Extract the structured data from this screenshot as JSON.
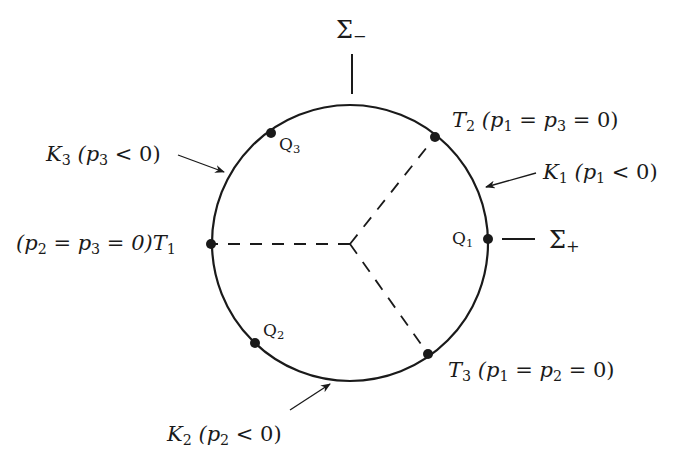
{
  "diagram": {
    "circle": {
      "cx": 350,
      "cy": 243,
      "r": 138,
      "stroke": "#1a1a1a"
    },
    "center": {
      "x": 350,
      "y": 244
    },
    "points": [
      {
        "id": "T1",
        "x": 211,
        "y": 244
      },
      {
        "id": "T2",
        "x": 435,
        "y": 137
      },
      {
        "id": "T3",
        "x": 428,
        "y": 354
      },
      {
        "id": "Q1",
        "x": 488,
        "y": 239
      },
      {
        "id": "Q2",
        "x": 255,
        "y": 343
      },
      {
        "id": "Q3",
        "x": 271,
        "y": 133
      }
    ],
    "labels": {
      "sigma_minus": {
        "sym": "Σ",
        "sub": "−"
      },
      "sigma_plus": {
        "sym": "Σ",
        "sub": "+"
      },
      "T1": {
        "cond": "(p",
        "s1": "2",
        "m1": " = p",
        "s2": "3",
        "m2": " = 0)T",
        "s3": "1"
      },
      "T2": {
        "name": "T",
        "nsub": "2",
        "cond1": " (p",
        "s1": "1",
        "m1": " = p",
        "s2": "3",
        "m2": " = 0)"
      },
      "T3": {
        "name": "T",
        "nsub": "3",
        "cond1": " (p",
        "s1": "1",
        "m1": " = p",
        "s2": "2",
        "m2": " = 0)"
      },
      "K1": {
        "name": "K",
        "nsub": "1",
        "cond1": " (p",
        "s1": "1",
        "m1": " < 0)"
      },
      "K2": {
        "name": "K",
        "nsub": "2",
        "cond1": " (p",
        "s1": "2",
        "m1": " < 0)"
      },
      "K3": {
        "name": "K",
        "nsub": "3",
        "cond1": " (p",
        "s1": "3",
        "m1": " < 0)"
      },
      "Q1": {
        "name": "Q",
        "nsub": "1"
      },
      "Q2": {
        "name": "Q",
        "nsub": "2"
      },
      "Q3": {
        "name": "Q",
        "nsub": "3"
      }
    }
  }
}
